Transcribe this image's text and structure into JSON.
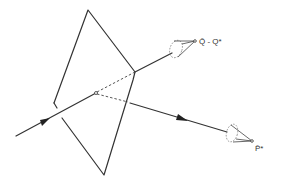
{
  "diagram": {
    "type": "ray-plane scattering diagram",
    "colors": {
      "ink": "#333333",
      "background": "#ffffff"
    },
    "plane": {
      "shape": "quadrilateral",
      "vertices": [
        [
          88,
          10
        ],
        [
          135,
          74
        ],
        [
          104,
          175
        ],
        [
          61,
          118
        ],
        [
          54,
          105
        ]
      ]
    },
    "incident_ray": {
      "from": [
        16,
        136
      ],
      "to": [
        96,
        93
      ],
      "arrow": "forward"
    },
    "interaction_point": [
      96,
      93
    ],
    "outgoing_rays": [
      {
        "name": "upper",
        "label": "Q̄ - Q*",
        "hidden_segment_to": [
          135,
          72
        ],
        "visible_to": [
          195,
          41
        ],
        "cone_tip": [
          195,
          41
        ]
      },
      {
        "name": "lower",
        "label": "P̄*",
        "hidden_segment_to": [
          130,
          104
        ],
        "visible_to": [
          252,
          141
        ],
        "cone_tip": [
          252,
          141
        ],
        "arrow": "forward"
      }
    ]
  },
  "labels": {
    "upper": "Q̄ - Q*",
    "lower": "P̄*"
  }
}
